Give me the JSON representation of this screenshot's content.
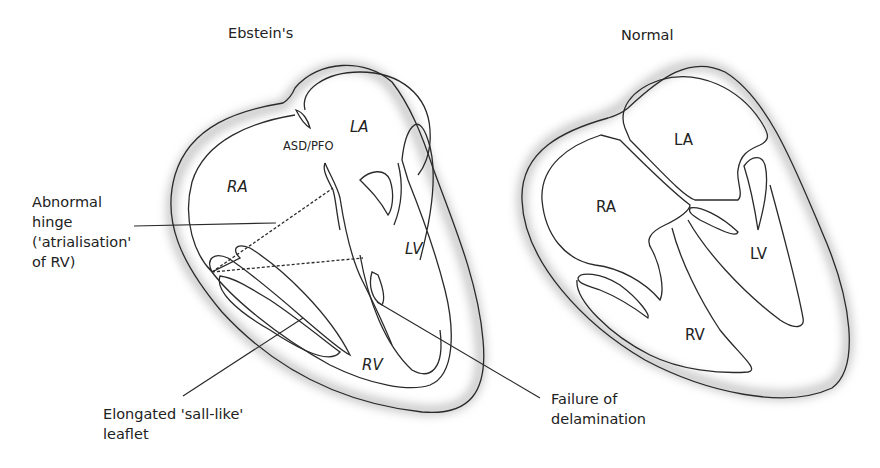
{
  "diagrams": [
    {
      "title": "Ebstein's",
      "chambers": {
        "ra": "RA",
        "la": "LA",
        "lv": "LV",
        "rv": "RV"
      },
      "defect_label": "ASD/PFO"
    },
    {
      "title": "Normal",
      "chambers": {
        "ra": "RA",
        "la": "LA",
        "lv": "LV",
        "rv": "RV"
      }
    }
  ],
  "annotations": {
    "abnormal_hinge": [
      "Abnormal",
      "hinge",
      "('atrialisation'",
      "of RV)"
    ],
    "elongated_leaflet": [
      "Elongated 'sall-like'",
      "leaflet"
    ],
    "failure_delamination": [
      "Failure of",
      "delamination"
    ]
  },
  "colors": {
    "line": "#2a2a2a",
    "shadow": "#bdbdbd",
    "background": "#ffffff"
  }
}
